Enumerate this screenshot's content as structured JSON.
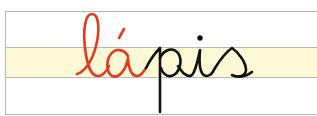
{
  "word": {
    "text": "lápis",
    "highlighted_part": "lá",
    "rest_part": "pis"
  },
  "colors": {
    "highlight": "#e23a1f",
    "ink": "#111111",
    "band": "#fdf8d6",
    "lines": "#b8b8b8"
  }
}
